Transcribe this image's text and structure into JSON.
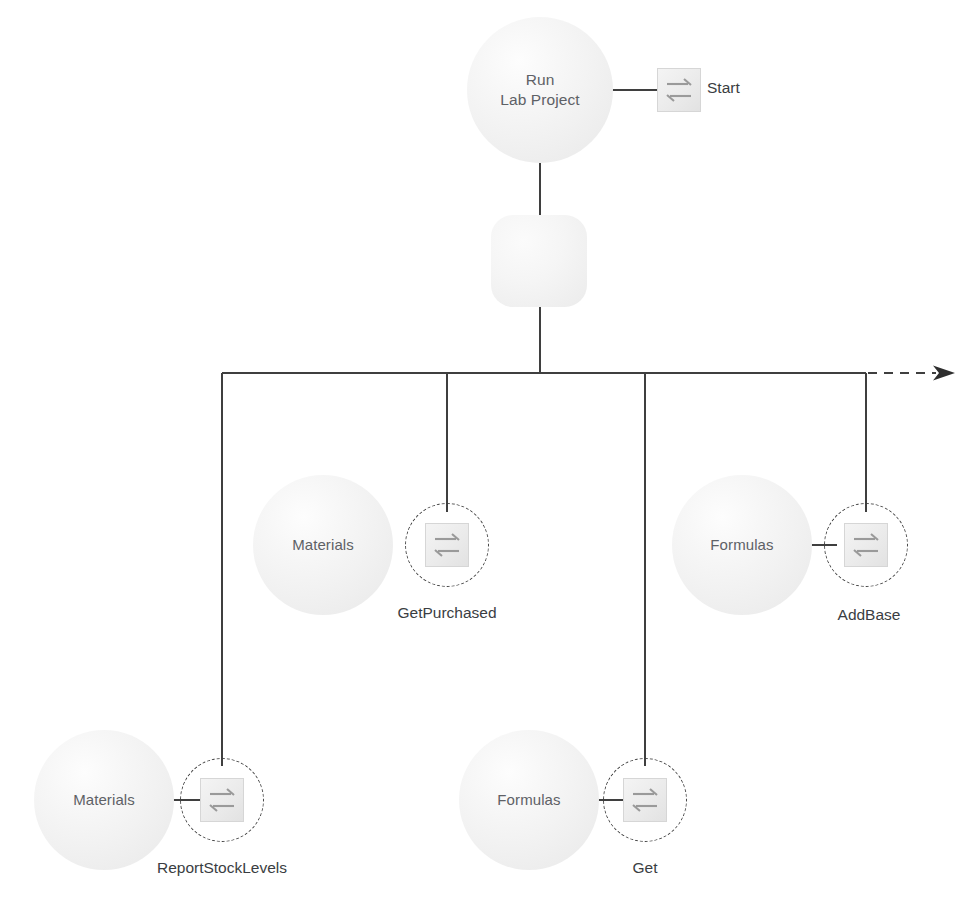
{
  "diagram": {
    "colors": {
      "line": "#3f3f3f",
      "sphere_fill": "#f1f1f1",
      "icon_fill": "#ebebeb",
      "icon_stroke": "#d6d6d6",
      "sphere_text": "#5e6166",
      "caption_text": "#3a3d42",
      "background": "#ffffff"
    },
    "root": {
      "name": "run-lab-project",
      "label": "Run\nLab Project",
      "message": {
        "name": "start",
        "label": "Start",
        "icon": "message-exchange-icon",
        "dashed": false
      }
    },
    "process_node": {
      "name": "process-step",
      "label": ""
    },
    "fork": {
      "name": "fork-bar",
      "continuation_arrow": "dashed-arrow-right"
    },
    "branches": [
      {
        "name": "materials-report-stock-levels",
        "object_label": "Materials",
        "message_label": "ReportStockLevels",
        "icon": "message-exchange-icon",
        "dashed": true
      },
      {
        "name": "materials-get-purchased",
        "object_label": "Materials",
        "message_label": "GetPurchased",
        "icon": "message-exchange-icon",
        "dashed": true
      },
      {
        "name": "formulas-get",
        "object_label": "Formulas",
        "message_label": "Get",
        "icon": "message-exchange-icon",
        "dashed": true
      },
      {
        "name": "formulas-add-base",
        "object_label": "Formulas",
        "message_label": "AddBase",
        "icon": "message-exchange-icon",
        "dashed": true
      }
    ]
  }
}
